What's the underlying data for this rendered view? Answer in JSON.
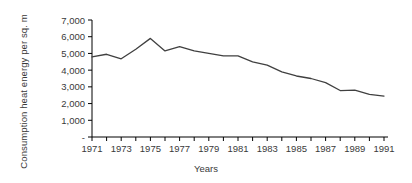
{
  "chart_data": {
    "type": "line",
    "title": "",
    "xlabel": "Years",
    "ylabel": "Consumption heat energy per sq. m",
    "ylabel_lines": [
      "Consumption heat energy per",
      "sq. m"
    ],
    "x": [
      1971,
      1972,
      1973,
      1974,
      1975,
      1976,
      1977,
      1978,
      1979,
      1980,
      1981,
      1982,
      1983,
      1984,
      1985,
      1986,
      1987,
      1988,
      1989,
      1990,
      1991
    ],
    "values": [
      4800,
      4950,
      4680,
      5250,
      5900,
      5150,
      5400,
      5150,
      5000,
      4850,
      4850,
      4500,
      4300,
      3900,
      3650,
      3500,
      3250,
      2780,
      2800,
      2550,
      2450
    ],
    "series": [
      {
        "name": "Consumption heat energy per sq. m",
        "values": [
          4800,
          4950,
          4680,
          5250,
          5900,
          5150,
          5400,
          5150,
          5000,
          4850,
          4850,
          4500,
          4300,
          3900,
          3650,
          3500,
          3250,
          2780,
          2800,
          2550,
          2450
        ]
      }
    ],
    "ylim": [
      0,
      7000
    ],
    "xlim": [
      1971,
      1991
    ],
    "ytick_values": [
      0,
      1000,
      2000,
      3000,
      4000,
      5000,
      6000,
      7000
    ],
    "ytick_labels": [
      "-",
      "1,000",
      "2,000",
      "3,000",
      "4,000",
      "5,000",
      "6,000",
      "7,000"
    ],
    "xtick_values": [
      1971,
      1972,
      1973,
      1974,
      1975,
      1976,
      1977,
      1978,
      1979,
      1980,
      1981,
      1982,
      1983,
      1984,
      1985,
      1986,
      1987,
      1988,
      1989,
      1990,
      1991
    ],
    "xtick_labels": [
      "1971",
      "",
      "1973",
      "",
      "1975",
      "",
      "1977",
      "",
      "1979",
      "",
      "1981",
      "",
      "1983",
      "",
      "1985",
      "",
      "1987",
      "",
      "1989",
      "",
      "1991"
    ],
    "grid": false,
    "legend": false,
    "legend_position": "none",
    "line_color": "#404040",
    "axis_color": "#000000",
    "background_color": "#ffffff"
  }
}
